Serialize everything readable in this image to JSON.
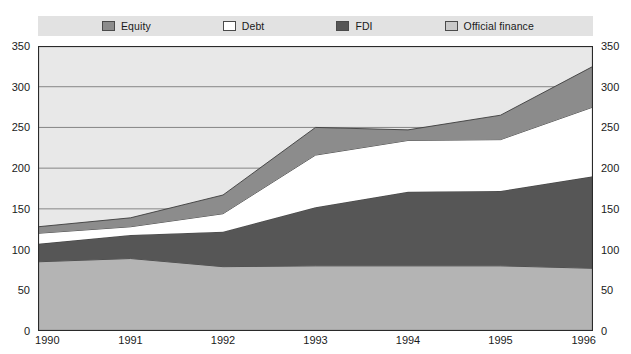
{
  "legend": {
    "items": [
      {
        "label": "Equity",
        "color": "#8c8c8c",
        "key": "equity"
      },
      {
        "label": "Debt",
        "color": "#ffffff",
        "key": "debt"
      },
      {
        "label": "FDI",
        "color": "#565656",
        "key": "fdi"
      },
      {
        "label": "Official finance",
        "color": "#b4b4b4",
        "key": "official_finance"
      }
    ]
  },
  "axes": {
    "y_ticks": [
      0,
      50,
      100,
      150,
      200,
      250,
      300,
      350
    ],
    "y_ticks_right": [
      0,
      50,
      100,
      150,
      200,
      250,
      300,
      350
    ],
    "x_ticks": [
      "1990",
      "1991",
      "1992",
      "1993",
      "1994",
      "1995",
      "1996"
    ]
  },
  "chart_data": {
    "type": "area",
    "stacked": true,
    "title": "",
    "subtitle": "",
    "xlabel": "",
    "ylabel": "",
    "x": [
      "1990",
      "1991",
      "1992",
      "1993",
      "1994",
      "1995",
      "1996"
    ],
    "ylim": [
      0,
      350
    ],
    "yticks": [
      0,
      50,
      100,
      150,
      200,
      250,
      300,
      350
    ],
    "grid": true,
    "legend_position": "top",
    "stack_order_bottom_to_top": [
      "Official finance",
      "FDI",
      "Debt",
      "Equity"
    ],
    "series": [
      {
        "name": "Official finance",
        "color": "#b4b4b4",
        "values": [
          85,
          89,
          79,
          80,
          80,
          80,
          77
        ]
      },
      {
        "name": "FDI",
        "color": "#565656",
        "values": [
          22,
          29,
          43,
          72,
          91,
          92,
          113
        ]
      },
      {
        "name": "Debt",
        "color": "#ffffff",
        "values": [
          13,
          10,
          22,
          64,
          63,
          63,
          85
        ]
      },
      {
        "name": "Equity",
        "color": "#8c8c8c",
        "values": [
          8,
          11,
          23,
          34,
          13,
          30,
          50
        ]
      }
    ],
    "cumulative_tops": {
      "official_finance": [
        85,
        89,
        79,
        80,
        80,
        80,
        77
      ],
      "fdi": [
        107,
        118,
        122,
        152,
        171,
        172,
        190
      ],
      "debt": [
        120,
        128,
        144,
        216,
        234,
        235,
        275
      ],
      "equity": [
        128,
        139,
        167,
        250,
        247,
        265,
        325
      ]
    }
  }
}
